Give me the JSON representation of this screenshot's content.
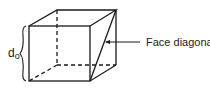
{
  "diagram": {
    "type": "cube-face-diagonal",
    "labels": {
      "edge_symbol": "d",
      "edge_subscript": "o",
      "diagonal_label": "Face diagonal"
    },
    "colors": {
      "line": "#1a1a1a",
      "background": "#ffffff"
    }
  }
}
